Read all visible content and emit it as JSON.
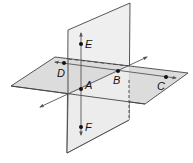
{
  "diagram": {
    "type": "intersecting-planes",
    "colors": {
      "plane_fill": "#dedede",
      "vertical_plane_fill": "#ededed",
      "edge": "#444444",
      "line": "#555555",
      "point": "#111111"
    },
    "points": [
      {
        "id": "E",
        "label": "E",
        "x": 81,
        "y": 44,
        "lx": 85,
        "ly": 48
      },
      {
        "id": "D",
        "label": "D",
        "x": 64,
        "y": 63,
        "lx": 57,
        "ly": 76
      },
      {
        "id": "A",
        "label": "A",
        "x": 81,
        "y": 89,
        "lx": 85,
        "ly": 89
      },
      {
        "id": "B",
        "label": "B",
        "x": 118,
        "y": 71,
        "lx": 114,
        "ly": 84
      },
      {
        "id": "C",
        "label": "C",
        "x": 166,
        "y": 77,
        "lx": 157,
        "ly": 90
      },
      {
        "id": "F",
        "label": "F",
        "x": 81,
        "y": 127,
        "lx": 85,
        "ly": 131
      }
    ],
    "lines": [
      {
        "id": "EF",
        "desc": "vertical line through E, A, F"
      },
      {
        "id": "AB",
        "desc": "line through A and B (intersection of planes)"
      },
      {
        "id": "DC",
        "desc": "line through D, B, C in horizontal plane"
      }
    ],
    "planes": [
      {
        "id": "horizontal",
        "desc": "horizontal plane containing D, A, B, C"
      },
      {
        "id": "vertical",
        "desc": "vertical plane containing E, A, F, B"
      }
    ]
  }
}
